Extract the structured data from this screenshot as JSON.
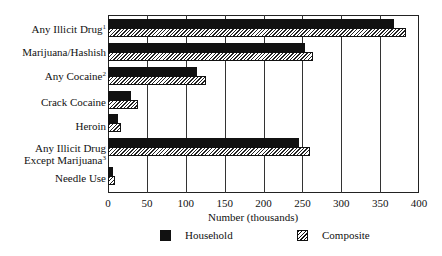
{
  "chart_data": {
    "type": "bar",
    "orientation": "horizontal",
    "title": "",
    "xlabel": "Number (thousands)",
    "ylabel": "",
    "xlim": [
      0,
      400
    ],
    "xticks": [
      0,
      50,
      100,
      150,
      200,
      250,
      300,
      350,
      400
    ],
    "grid": "vertical",
    "legend_position": "bottom",
    "categories": [
      {
        "label": "Any Illicit Drug",
        "sup": "1"
      },
      {
        "label": "Marijuana/Hashish",
        "sup": ""
      },
      {
        "label": "Any Cocaine",
        "sup": "2"
      },
      {
        "label": "Crack Cocaine",
        "sup": ""
      },
      {
        "label": "Heroin",
        "sup": ""
      },
      {
        "label": "Any Illicit Drug\nExcept Marijuana",
        "sup": "3"
      },
      {
        "label": "Needle Use",
        "sup": ""
      }
    ],
    "series": [
      {
        "name": "Household",
        "pattern": "solid",
        "color": "#111111",
        "values": [
          368,
          253,
          114,
          29,
          13,
          246,
          6
        ]
      },
      {
        "name": "Composite",
        "pattern": "hatched",
        "color": "#111111",
        "values": [
          383,
          264,
          126,
          38,
          17,
          260,
          9
        ]
      }
    ]
  },
  "legend": {
    "household": "Household",
    "composite": "Composite"
  },
  "axis": {
    "xlabel": "Number (thousands)",
    "ticks": [
      "0",
      "50",
      "100",
      "150",
      "200",
      "250",
      "300",
      "350",
      "400"
    ]
  },
  "labels": {
    "c0": "Any Illicit Drug",
    "c0sup": "1",
    "c1": "Marijuana/Hashish",
    "c2": "Any Cocaine",
    "c2sup": "2",
    "c3": "Crack Cocaine",
    "c4": "Heroin",
    "c5a": "Any Illicit Drug",
    "c5b": "Except Marijuana",
    "c5sup": "3",
    "c6": "Needle Use"
  }
}
